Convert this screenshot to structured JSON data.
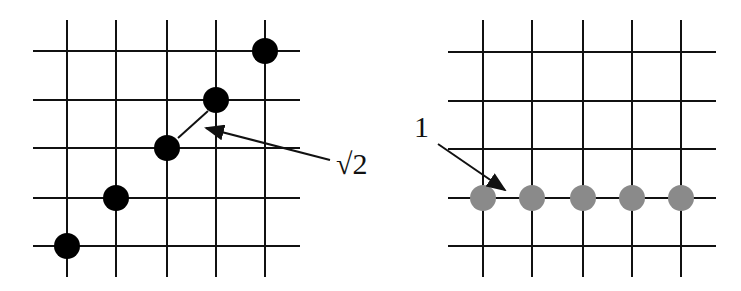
{
  "left_panel": {
    "grid": {
      "v_lines_x": [
        67,
        116,
        167,
        216,
        265
      ],
      "h_lines_y": [
        51,
        100,
        148,
        198,
        246
      ],
      "x_span": [
        33,
        300
      ],
      "y_span": [
        20,
        277
      ]
    },
    "dots": [
      {
        "x": 67,
        "y": 246
      },
      {
        "x": 116,
        "y": 198
      },
      {
        "x": 167,
        "y": 148
      },
      {
        "x": 216,
        "y": 100
      },
      {
        "x": 265,
        "y": 51
      }
    ],
    "dot_color": "#000000",
    "connector": {
      "x1": 178,
      "y1": 138,
      "x2": 208,
      "y2": 111
    },
    "annotation": {
      "label": "√2",
      "text_x": 336,
      "text_y": 174
    }
  },
  "right_panel": {
    "grid": {
      "v_lines_x": [
        483,
        532,
        583,
        632,
        681
      ],
      "h_lines_y": [
        52,
        101,
        149,
        198,
        246
      ],
      "x_span": [
        448,
        716
      ],
      "y_span": [
        20,
        277
      ]
    },
    "dots": [
      {
        "x": 483,
        "y": 198
      },
      {
        "x": 532,
        "y": 198
      },
      {
        "x": 583,
        "y": 198
      },
      {
        "x": 632,
        "y": 198
      },
      {
        "x": 681,
        "y": 198
      }
    ],
    "dot_color": "#8a8a8a",
    "annotation": {
      "label": "1",
      "text_x": 414,
      "text_y": 137
    }
  }
}
